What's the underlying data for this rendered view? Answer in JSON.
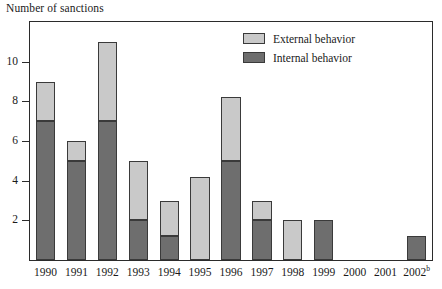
{
  "chart_data": {
    "type": "bar",
    "title": "",
    "ylabel": "Number of sanctions",
    "xlabel": "",
    "stacked": true,
    "grid": false,
    "legend_position": "top-right",
    "ylim": [
      0,
      12
    ],
    "yticks": [
      2,
      4,
      6,
      8,
      10
    ],
    "ytick_labels": [
      "2",
      "4",
      "6",
      "8",
      "10"
    ],
    "categories": [
      "1990",
      "1991",
      "1992",
      "1993",
      "1994",
      "1995",
      "1996",
      "1997",
      "1998",
      "1999",
      "2000",
      "2001",
      "2002"
    ],
    "category_footnotes": [
      "",
      "",
      "",
      "",
      "",
      "",
      "",
      "",
      "",
      "",
      "",
      "",
      "b"
    ],
    "series": [
      {
        "name": "Internal behavior",
        "color": "#6e6e6e",
        "values": [
          7,
          5,
          7,
          2,
          1.2,
          0,
          5,
          2,
          0,
          2,
          0,
          0,
          1.2
        ]
      },
      {
        "name": "External behavior",
        "color": "#c9c9c9",
        "values": [
          2,
          1,
          4,
          3,
          1.8,
          4.2,
          3.2,
          1,
          2,
          0,
          0,
          0,
          0
        ]
      }
    ],
    "totals": [
      9,
      6,
      11,
      5,
      3,
      4.2,
      8.2,
      3,
      2,
      2,
      0,
      0,
      1.2
    ]
  },
  "legend": {
    "items": [
      {
        "label": "External behavior",
        "color": "#c9c9c9"
      },
      {
        "label": "Internal behavior",
        "color": "#6e6e6e"
      }
    ]
  }
}
